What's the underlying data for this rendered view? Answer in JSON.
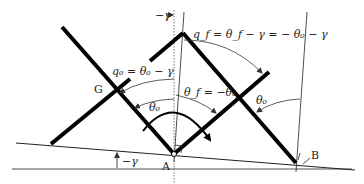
{
  "diagram": {
    "points": {
      "A": "A",
      "B": "B",
      "G": "G"
    },
    "labels": {
      "neg_gamma_top": "−γ",
      "neg_gamma_bottom": "−γ",
      "q0_eq": "q₀ = θ₀ − γ",
      "qf_eq": "q_f = θ_f − γ = − θ₀ − γ",
      "theta_f_eq": "θ_f = −θ₀",
      "theta0_left": "θ₀",
      "theta0_right": "θ₀"
    }
  }
}
